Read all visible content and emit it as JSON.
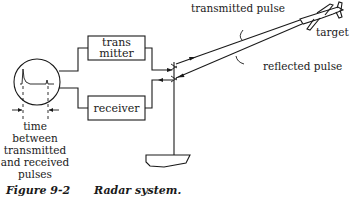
{
  "diagram": {
    "figure_number": "Figure 9-2",
    "caption": "Radar system.",
    "blocks": {
      "transmitter_line1": "trans",
      "transmitter_line2": "mitter",
      "receiver": "receiver"
    },
    "labels": {
      "transmitted_pulse": "transmitted pulse",
      "reflected_pulse": "reflected pulse",
      "target": "target",
      "time_line1": "time",
      "time_line2": "between",
      "time_line3": "transmitted",
      "time_line4": "and received",
      "time_line5": "pulses"
    }
  }
}
